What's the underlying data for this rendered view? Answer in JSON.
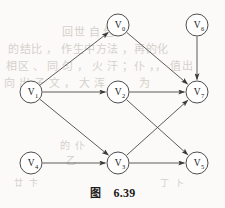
{
  "figure": {
    "caption_label": "图",
    "caption_number": "6.39",
    "type": "directed-acyclic-graph"
  },
  "bleed_through_text": {
    "line1": "回世 自 包 ",
    "line2": "的结比 ， 作生中方法 ，再的化",
    "line3": "相区 、 同 匀 ， 火 汗 ；仆 ，， 值出",
    "line4": "向 出 子 文 ， 大 浑 灬 ， 为",
    "line5": "的 仆",
    "line6": "乙",
    "line7": "廿 卞",
    "line8": "丁 卜"
  },
  "chart_data": {
    "type": "diagram",
    "nodes": [
      {
        "id": "V0",
        "label": "V",
        "subscript": "0",
        "x": 118,
        "y": 25,
        "r": 11
      },
      {
        "id": "V6",
        "label": "V",
        "subscript": "6",
        "x": 197,
        "y": 25,
        "r": 11
      },
      {
        "id": "V1",
        "label": "V",
        "subscript": "1",
        "x": 31,
        "y": 92,
        "r": 11
      },
      {
        "id": "V2",
        "label": "V",
        "subscript": "2",
        "x": 118,
        "y": 92,
        "r": 11
      },
      {
        "id": "V7",
        "label": "V",
        "subscript": "7",
        "x": 197,
        "y": 92,
        "r": 11
      },
      {
        "id": "V4",
        "label": "V",
        "subscript": "4",
        "x": 31,
        "y": 163,
        "r": 11
      },
      {
        "id": "V3",
        "label": "V",
        "subscript": "3",
        "x": 118,
        "y": 163,
        "r": 11
      },
      {
        "id": "V5",
        "label": "V",
        "subscript": "5",
        "x": 197,
        "y": 163,
        "r": 11
      }
    ],
    "edges": [
      {
        "from": "V1",
        "to": "V0",
        "directed": true
      },
      {
        "from": "V1",
        "to": "V2",
        "directed": true
      },
      {
        "from": "V1",
        "to": "V3",
        "directed": true
      },
      {
        "from": "V0",
        "to": "V7",
        "directed": true
      },
      {
        "from": "V6",
        "to": "V7",
        "directed": true
      },
      {
        "from": "V2",
        "to": "V7",
        "directed": true
      },
      {
        "from": "V2",
        "to": "V5",
        "directed": true
      },
      {
        "from": "V3",
        "to": "V7",
        "directed": true
      },
      {
        "from": "V3",
        "to": "V5",
        "directed": true
      },
      {
        "from": "V4",
        "to": "V3",
        "directed": true
      }
    ],
    "node_count": 8,
    "edge_count": 10,
    "colors": {
      "node_stroke": "#3a3a3a",
      "node_fill": "#ffffff",
      "edge_stroke": "#4a4a4a",
      "label_color": "#1b1b1b",
      "background": "#fbfaf8"
    }
  }
}
